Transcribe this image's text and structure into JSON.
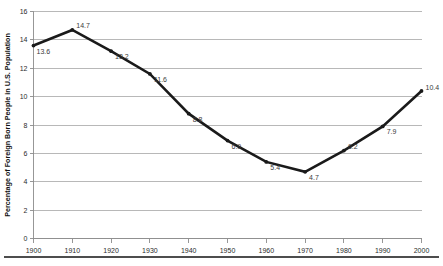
{
  "chart_data": {
    "type": "line",
    "title": "",
    "xlabel": "",
    "ylabel": "Percentage of Foreign Born People in U.S. Population",
    "x": [
      1900,
      1910,
      1920,
      1930,
      1940,
      1950,
      1960,
      1970,
      1980,
      1990,
      2000
    ],
    "values": [
      13.6,
      14.7,
      13.2,
      11.6,
      8.8,
      6.9,
      5.4,
      4.7,
      6.2,
      7.9,
      10.4
    ],
    "point_labels": [
      "13.6",
      "14.7",
      "13.2",
      "11.6",
      "8.8",
      "6.9",
      "5.4",
      "4.7",
      "6.2",
      "7.9",
      "10.4"
    ],
    "xtick_labels": [
      "1900",
      "1910",
      "1920",
      "1930",
      "1940",
      "1950",
      "1960",
      "1970",
      "1980",
      "1990",
      "2000"
    ],
    "ytick_labels": [
      "0",
      "2",
      "4",
      "6",
      "8",
      "10",
      "12",
      "14",
      "16"
    ],
    "yticks": [
      0,
      2,
      4,
      6,
      8,
      10,
      12,
      14,
      16
    ],
    "xlim": [
      1900,
      2000
    ],
    "ylim": [
      0,
      16
    ],
    "grid": "horizontal",
    "legend": "none",
    "series_color": "#1a1a1a",
    "grid_color": "#a6a6a6",
    "axis_color": "#8c8c8c",
    "background": "#ffffff"
  }
}
